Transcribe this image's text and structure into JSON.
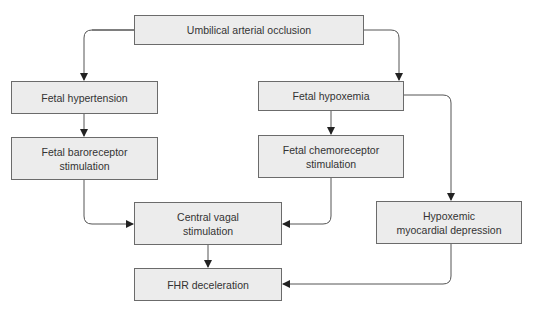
{
  "diagram": {
    "type": "flowchart",
    "nodes": [
      {
        "id": "umbilical",
        "label": "Umbilical arterial occlusion"
      },
      {
        "id": "hypertension",
        "label": "Fetal hypertension"
      },
      {
        "id": "baroreceptor",
        "line1": "Fetal baroreceptor",
        "line2": "stimulation"
      },
      {
        "id": "hypoxemia",
        "label": "Fetal hypoxemia"
      },
      {
        "id": "chemoreceptor",
        "line1": "Fetal chemoreceptor",
        "line2": "stimulation"
      },
      {
        "id": "vagal",
        "line1": "Central vagal",
        "line2": "stimulation"
      },
      {
        "id": "myocardial",
        "line1": "Hypoxemic",
        "line2": "myocardial depression"
      },
      {
        "id": "fhr",
        "label": "FHR deceleration"
      }
    ],
    "edges": [
      {
        "from": "umbilical",
        "to": "hypertension"
      },
      {
        "from": "umbilical",
        "to": "hypoxemia"
      },
      {
        "from": "hypertension",
        "to": "baroreceptor"
      },
      {
        "from": "hypoxemia",
        "to": "chemoreceptor"
      },
      {
        "from": "hypoxemia",
        "to": "myocardial"
      },
      {
        "from": "baroreceptor",
        "to": "vagal"
      },
      {
        "from": "chemoreceptor",
        "to": "vagal"
      },
      {
        "from": "vagal",
        "to": "fhr"
      },
      {
        "from": "myocardial",
        "to": "fhr"
      }
    ],
    "colors": {
      "box_fill": "#ececec",
      "box_border": "#6b6b6b",
      "line": "#555555",
      "text": "#333333"
    }
  }
}
